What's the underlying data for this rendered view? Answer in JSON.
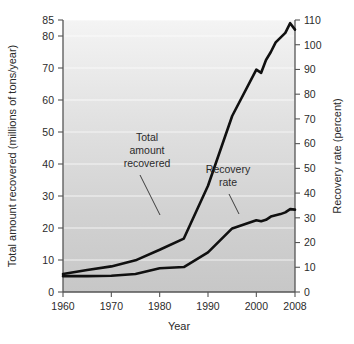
{
  "chart_data": {
    "type": "line",
    "title": "",
    "xlabel": "Year",
    "ylabel": "Total amount recovered (millions of tons/year)",
    "y2label": "Recovery rate (percent)",
    "grid": true,
    "legend": "none",
    "annotations_style": "inline-labels-with-leader-lines",
    "xlim": [
      1960,
      2008
    ],
    "ylim": [
      0,
      85
    ],
    "y2lim": [
      0,
      110
    ],
    "xticks": [
      1960,
      1970,
      1980,
      1990,
      2000,
      2008
    ],
    "xtick_labels": [
      "1960",
      "1970",
      "1980",
      "1990",
      "2000",
      "2008"
    ],
    "yticks": [
      0,
      10,
      20,
      30,
      40,
      50,
      60,
      70,
      80,
      85
    ],
    "ytick_labels": [
      "0",
      "10",
      "20",
      "30",
      "40",
      "50",
      "60",
      "70",
      "80",
      "85"
    ],
    "y2ticks": [
      0,
      10,
      20,
      30,
      40,
      50,
      60,
      70,
      80,
      90,
      100,
      110
    ],
    "y2tick_labels": [
      "0",
      "10",
      "20",
      "30",
      "40",
      "50",
      "60",
      "70",
      "80",
      "90",
      "100",
      "110"
    ],
    "x": [
      1960,
      1965,
      1970,
      1975,
      1980,
      1985,
      1990,
      1995,
      2000,
      2001,
      2002,
      2003,
      2004,
      2005,
      2006,
      2007,
      2008
    ],
    "series": [
      {
        "name": "Total amount recovered",
        "axis": "left",
        "units": "millions of tons/year",
        "values": [
          5.6,
          6.9,
          8.0,
          9.9,
          13.2,
          16.7,
          33.2,
          55.0,
          69.5,
          68.5,
          72.5,
          75.0,
          78.0,
          79.5,
          81.0,
          84.0,
          82.0
        ]
      },
      {
        "name": "Recovery rate",
        "axis": "right",
        "units": "percent",
        "values": [
          6.4,
          6.4,
          6.6,
          7.3,
          9.6,
          10.1,
          16.0,
          25.7,
          29.0,
          28.6,
          29.2,
          30.5,
          31.0,
          31.5,
          32.2,
          33.5,
          33.3
        ]
      }
    ]
  },
  "annotations": [
    {
      "name": "total-amount-recovered",
      "lines": [
        "Total",
        "amount",
        "recovered"
      ]
    },
    {
      "name": "recovery-rate",
      "lines": [
        "Recovery",
        "rate"
      ]
    }
  ],
  "colors": {
    "line": "#101010",
    "axis": "#555555",
    "plot_bg_top": "#f2f2f2",
    "plot_bg_bottom": "#c9c9c9",
    "grid": "#ffffff",
    "text": "#2b2b2b"
  }
}
